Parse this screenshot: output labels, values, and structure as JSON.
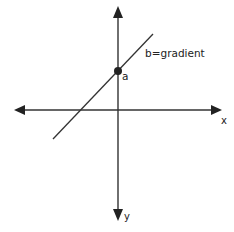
{
  "diagram": {
    "type": "coordinate-axes-line",
    "labels": {
      "x_axis": "x",
      "y_axis": "y",
      "intercept_point": "a",
      "line_label": "b=gradient"
    },
    "colors": {
      "stroke": "#222222",
      "background": "#ffffff"
    }
  }
}
